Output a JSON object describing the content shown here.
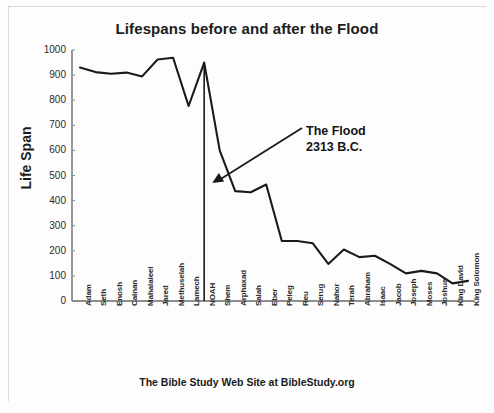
{
  "chart_data": {
    "type": "line",
    "title": "Lifespans before and after the Flood",
    "xlabel": "",
    "ylabel": "Life Span",
    "ylim": [
      0,
      1000
    ],
    "yticks": [
      1000,
      900,
      800,
      700,
      600,
      500,
      400,
      300,
      200,
      100,
      0
    ],
    "grid": false,
    "legend": null,
    "categories": [
      "Adam",
      "Seth",
      "Enosh",
      "Cainan",
      "Mahalaleel",
      "Jared",
      "Methuselah",
      "Lamech",
      "NOAH",
      "Shem",
      "Arphaxad",
      "Salah",
      "Eber",
      "Peleg",
      "Reu",
      "Serug",
      "Nahor",
      "Terah",
      "Abraham",
      "Isaac",
      "Jacob",
      "Joseph",
      "Moses",
      "Joshua",
      "King David",
      "King Solomon"
    ],
    "values": [
      930,
      912,
      905,
      910,
      895,
      962,
      969,
      777,
      950,
      600,
      438,
      433,
      464,
      239,
      239,
      230,
      148,
      205,
      175,
      180,
      147,
      110,
      120,
      110,
      70,
      80
    ],
    "series": [
      {
        "name": "Life Span",
        "values": [
          930,
          912,
          905,
          910,
          895,
          962,
          969,
          777,
          950,
          600,
          438,
          433,
          464,
          239,
          239,
          230,
          148,
          205,
          175,
          180,
          147,
          110,
          120,
          110,
          70,
          80
        ]
      }
    ],
    "annotations": [
      {
        "name": "flood-annotation",
        "line1": "The Flood",
        "line2": "2313 B.C.",
        "target_category": "NOAH",
        "marker": "vertical-line"
      }
    ],
    "line_color": "#1a1a1a",
    "axis_color": "#555555"
  },
  "caption": "The Bible Study Web Site at BibleStudy.org"
}
